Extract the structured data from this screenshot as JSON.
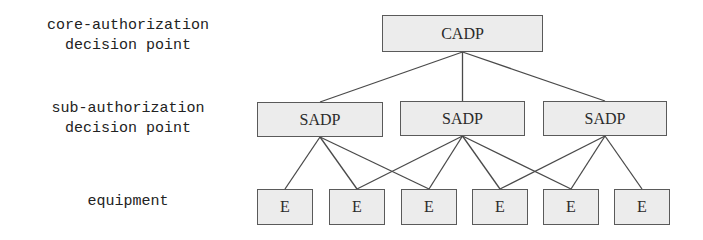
{
  "level_labels": [
    {
      "text": "core-authorization\ndecision point",
      "x": 128,
      "y": 16
    },
    {
      "text": "sub-authorization\ndecision point",
      "x": 128,
      "y": 99
    },
    {
      "text": "equipment",
      "x": 128,
      "y": 192
    }
  ],
  "colors": {
    "node_fill": "#ececec",
    "node_border": "#5a5a5a",
    "edge": "#4a4a4a"
  },
  "nodes": {
    "core": {
      "label": "CADP",
      "x": 382,
      "y": 15,
      "w": 161,
      "h": 37
    },
    "sub": [
      {
        "label": "SADP",
        "x": 257,
        "y": 102,
        "w": 126,
        "h": 35
      },
      {
        "label": "SADP",
        "x": 400,
        "y": 101,
        "w": 125,
        "h": 35
      },
      {
        "label": "SADP",
        "x": 543,
        "y": 101,
        "w": 124,
        "h": 35
      }
    ],
    "equipment": [
      {
        "label": "E",
        "x": 257,
        "y": 189,
        "w": 56,
        "h": 36
      },
      {
        "label": "E",
        "x": 329,
        "y": 189,
        "w": 56,
        "h": 36
      },
      {
        "label": "E",
        "x": 401,
        "y": 189,
        "w": 56,
        "h": 36
      },
      {
        "label": "E",
        "x": 472,
        "y": 189,
        "w": 56,
        "h": 36
      },
      {
        "label": "E",
        "x": 543,
        "y": 189,
        "w": 56,
        "h": 36
      },
      {
        "label": "E",
        "x": 614,
        "y": 189,
        "w": 56,
        "h": 36
      }
    ]
  },
  "edges": [
    {
      "from": "core",
      "to": "sub.0"
    },
    {
      "from": "core",
      "to": "sub.1"
    },
    {
      "from": "core",
      "to": "sub.2"
    },
    {
      "from": "sub.0",
      "to": "equipment.0"
    },
    {
      "from": "sub.0",
      "to": "equipment.1"
    },
    {
      "from": "sub.0",
      "to": "equipment.2"
    },
    {
      "from": "sub.1",
      "to": "equipment.1"
    },
    {
      "from": "sub.1",
      "to": "equipment.2"
    },
    {
      "from": "sub.1",
      "to": "equipment.3"
    },
    {
      "from": "sub.1",
      "to": "equipment.4"
    },
    {
      "from": "sub.2",
      "to": "equipment.3"
    },
    {
      "from": "sub.2",
      "to": "equipment.4"
    },
    {
      "from": "sub.2",
      "to": "equipment.5"
    }
  ]
}
